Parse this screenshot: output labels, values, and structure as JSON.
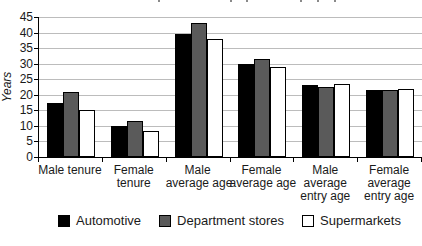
{
  "chart_data": {
    "type": "bar",
    "title": "",
    "xlabel": "",
    "ylabel": "Years",
    "ylim": [
      0,
      45
    ],
    "yticks": [
      45,
      40,
      35,
      30,
      25,
      20,
      15,
      10,
      5,
      0
    ],
    "grid": true,
    "legend_position": "bottom",
    "categories": [
      "Male tenure",
      "Female tenure",
      "Male average age",
      "Female average age",
      "Male average entry age",
      "Female average entry age"
    ],
    "category_lines": [
      [
        "Male tenure"
      ],
      [
        "Female",
        "tenure"
      ],
      [
        "Male",
        "average age"
      ],
      [
        "Female",
        "average age"
      ],
      [
        "Male",
        "average",
        "entry age"
      ],
      [
        "Female",
        "average",
        "entry age"
      ]
    ],
    "series": [
      {
        "name": "Automotive",
        "color": "#000000",
        "values": [
          17.5,
          10,
          39.5,
          30,
          23,
          21.5
        ]
      },
      {
        "name": "Department stores",
        "color": "#5a5a5a",
        "values": [
          21,
          11.5,
          43,
          31.5,
          22.5,
          21.5
        ]
      },
      {
        "name": "Supermarkets",
        "color": "#ffffff",
        "values": [
          15,
          8.5,
          38,
          29,
          23.5,
          22
        ]
      }
    ]
  },
  "colors": {
    "axis": "#000000",
    "gridline": "#bcbcbc",
    "bar_border": "#000000",
    "text": "#1a1a1a"
  }
}
